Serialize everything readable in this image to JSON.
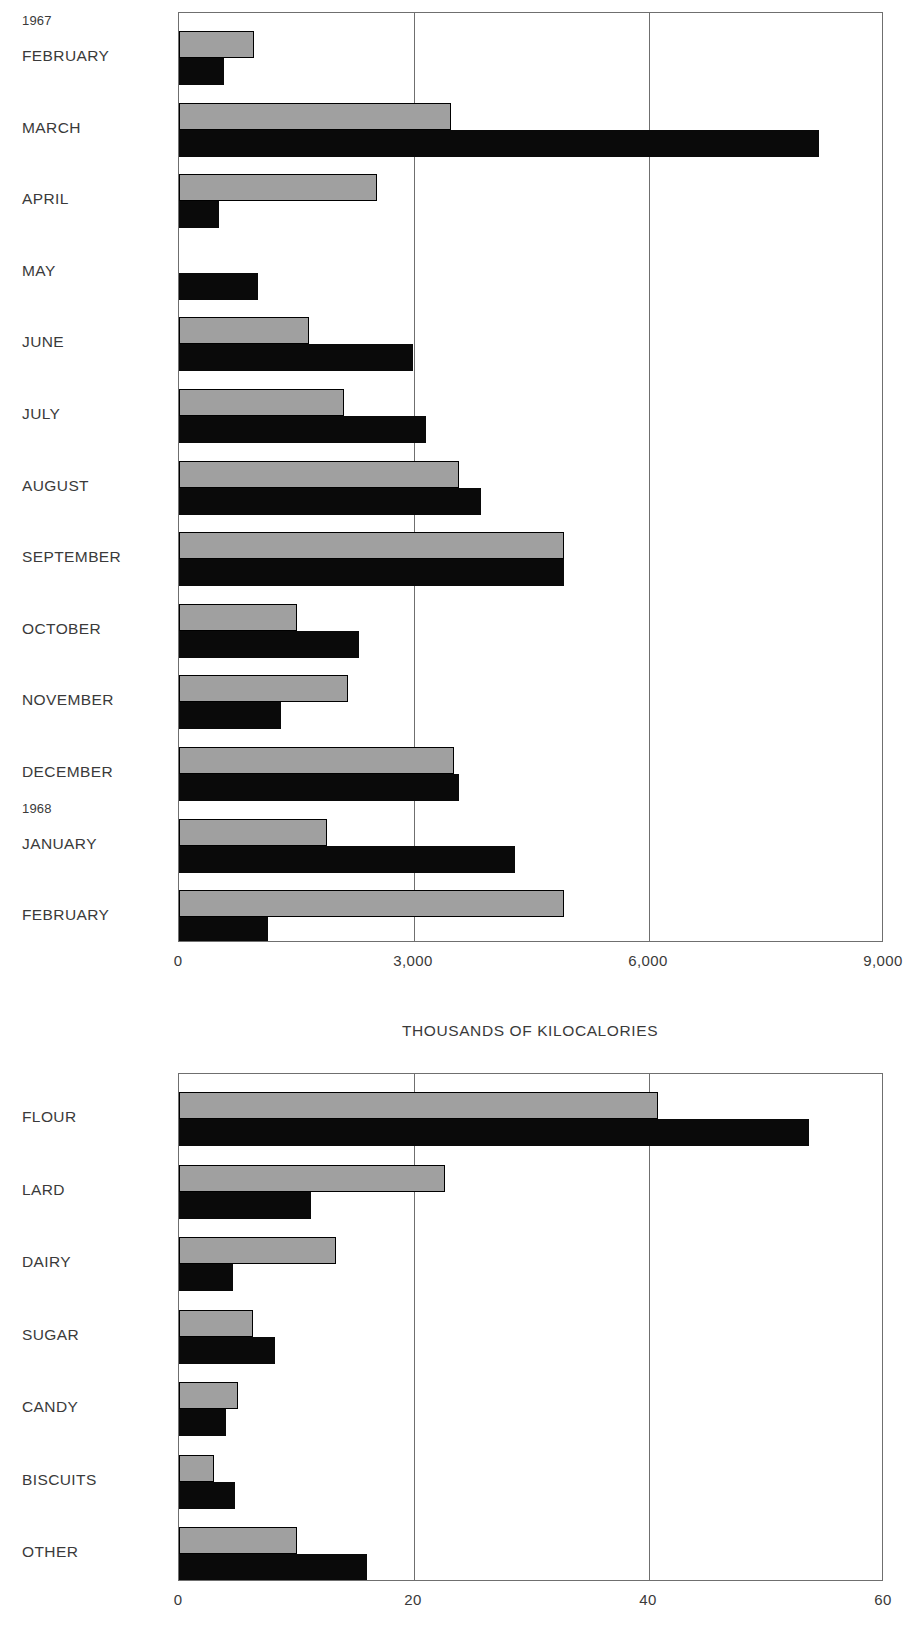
{
  "chart_data": [
    {
      "type": "bar",
      "orientation": "horizontal",
      "title": "",
      "xlabel": "THOUSANDS OF KILOCALORIES",
      "ylabel": "",
      "xlim": [
        0,
        9000
      ],
      "xticks": [
        0,
        3000,
        6000,
        9000
      ],
      "xtick_labels": [
        "0",
        "3,000",
        "6,000",
        "9,000"
      ],
      "grid": true,
      "grid_axis": "x",
      "legend": "none",
      "categories": [
        "FEBRUARY",
        "MARCH",
        "APRIL",
        "MAY",
        "JUNE",
        "JULY",
        "AUGUST",
        "SEPTEMBER",
        "OCTOBER",
        "NOVEMBER",
        "DECEMBER",
        "JANUARY",
        "FEBRUARY"
      ],
      "group_annotations": [
        {
          "label": "1967",
          "before_category_index": 0
        },
        {
          "label": "1968",
          "before_category_index": 11
        }
      ],
      "series": [
        {
          "name": "gray",
          "color": "#a0a0a0",
          "values": [
            960,
            3470,
            2530,
            0,
            1660,
            2110,
            3570,
            4920,
            1500,
            2160,
            3510,
            1890,
            4920
          ]
        },
        {
          "name": "black",
          "color": "#0a0a0a",
          "values": [
            575,
            8170,
            510,
            1010,
            2990,
            3150,
            3860,
            4920,
            2300,
            1300,
            3570,
            4290,
            1140
          ]
        }
      ]
    },
    {
      "type": "bar",
      "orientation": "horizontal",
      "title": "",
      "xlabel": "CALORIES  (PERCENT)",
      "ylabel": "",
      "xlim": [
        0,
        60
      ],
      "xticks": [
        0,
        20,
        40,
        60
      ],
      "xtick_labels": [
        "0",
        "20",
        "40",
        "60"
      ],
      "grid": true,
      "grid_axis": "x",
      "legend": "none",
      "categories": [
        "FLOUR",
        "LARD",
        "DAIRY",
        "SUGAR",
        "CANDY",
        "BISCUITS",
        "OTHER"
      ],
      "group_annotations": [],
      "series": [
        {
          "name": "gray",
          "color": "#a0a0a0",
          "values": [
            40.8,
            22.6,
            13.4,
            6.3,
            5.0,
            3.0,
            10.0
          ]
        },
        {
          "name": "black",
          "color": "#0a0a0a",
          "values": [
            53.6,
            11.2,
            4.6,
            8.2,
            4.0,
            4.8,
            16.0
          ]
        }
      ]
    }
  ],
  "charts": [
    {
      "name": "monthly-kilocalories",
      "axis_title": "THOUSANDS OF KILOCALORIES",
      "tick_labels": [
        "0",
        "3,000",
        "6,000",
        "9,000"
      ],
      "year_labels": [
        "1967",
        "1968"
      ],
      "categories": [
        "FEBRUARY",
        "MARCH",
        "APRIL",
        "MAY",
        "JUNE",
        "JULY",
        "AUGUST",
        "SEPTEMBER",
        "OCTOBER",
        "NOVEMBER",
        "DECEMBER",
        "JANUARY",
        "FEBRUARY"
      ]
    },
    {
      "name": "calorie-source-percent",
      "axis_title": "CALORIES  (PERCENT)",
      "tick_labels": [
        "0",
        "20",
        "40",
        "60"
      ],
      "year_labels": [],
      "categories": [
        "FLOUR",
        "LARD",
        "DAIRY",
        "SUGAR",
        "CANDY",
        "BISCUITS",
        "OTHER"
      ]
    }
  ],
  "colors": {
    "gray_series": "#a0a0a0",
    "black_series": "#0a0a0a",
    "frame": "#6f6f6f",
    "text": "#3a3a3a",
    "background": "#ffffff"
  }
}
